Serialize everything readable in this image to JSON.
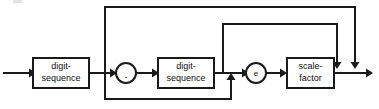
{
  "diagram": {
    "kind": "railroad-syntax-diagram",
    "line_color": "#1a1a1a",
    "background_color": "#ffffff",
    "nodes": [
      {
        "id": "digit-sequence-integer",
        "shape": "box",
        "label_line1": "digit-",
        "label_line2": "sequence"
      },
      {
        "id": "decimal-point",
        "shape": "circle",
        "label": "."
      },
      {
        "id": "digit-sequence-fraction",
        "shape": "box",
        "label_line1": "digit-",
        "label_line2": "sequence"
      },
      {
        "id": "exponent-marker",
        "shape": "circle",
        "label": "e"
      },
      {
        "id": "scale-factor",
        "shape": "box",
        "label_line1": "scale-",
        "label_line2": "factor"
      }
    ],
    "paths": [
      {
        "id": "main-path",
        "from": "input",
        "to": "output",
        "description": "digit-sequence then . then digit-sequence then e then scale-factor"
      },
      {
        "id": "outer-bypass",
        "from": "digit-sequence-integer",
        "to": "output",
        "description": "skips fraction and exponent"
      },
      {
        "id": "inner-bypass",
        "from": "digit-sequence-fraction",
        "to": "output",
        "description": "skips exponent"
      },
      {
        "id": "lower-bypass",
        "from": "digit-sequence-integer",
        "to": "exponent-marker",
        "description": "skips decimal point and fraction"
      }
    ]
  }
}
